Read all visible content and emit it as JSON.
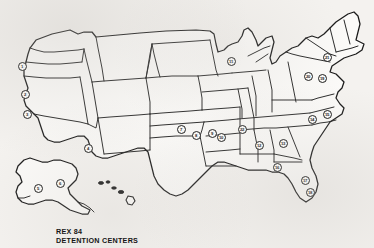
{
  "document": {
    "title": "REX 84 DETENTION CENTERS",
    "type": "map",
    "region": "United States"
  },
  "caption": {
    "line1": "REX 84",
    "line2": "DETENTION CENTERS"
  },
  "colors": {
    "background": "#f4f2ef",
    "land_fill": "#fbfaf8",
    "outline": "#1a1a1a",
    "marker_fill": "#fcfbf9",
    "text": "#151515"
  },
  "map": {
    "projection_note": "conterminous United States with Alaska and Hawaii insets",
    "marker_count": 22,
    "markers": [
      {
        "id": 1,
        "label": "1",
        "x": 22,
        "y": 66,
        "area": "Washington"
      },
      {
        "id": 2,
        "label": "2",
        "x": 25,
        "y": 94,
        "area": "California-north"
      },
      {
        "id": 3,
        "label": "3",
        "x": 27,
        "y": 114,
        "area": "California-central"
      },
      {
        "id": 4,
        "label": "4",
        "x": 88,
        "y": 148,
        "area": "Arizona-New-Mexico"
      },
      {
        "id": 5,
        "label": "5",
        "x": 38,
        "y": 188,
        "area": "Alaska-west"
      },
      {
        "id": 6,
        "label": "6",
        "x": 60,
        "y": 183,
        "area": "Alaska-central"
      },
      {
        "id": 7,
        "label": "7",
        "x": 181,
        "y": 129,
        "area": "Oklahoma"
      },
      {
        "id": 8,
        "label": "8",
        "x": 196,
        "y": 135,
        "area": "Arkansas-west"
      },
      {
        "id": 9,
        "label": "9",
        "x": 212,
        "y": 133,
        "area": "Arkansas-east"
      },
      {
        "id": 10,
        "label": "10",
        "x": 221,
        "y": 137,
        "area": "Mississippi"
      },
      {
        "id": 11,
        "label": "11",
        "x": 231,
        "y": 61,
        "area": "Wisconsin"
      },
      {
        "id": 12,
        "label": "12",
        "x": 259,
        "y": 145,
        "area": "Alabama"
      },
      {
        "id": 13,
        "label": "13",
        "x": 283,
        "y": 143,
        "area": "Georgia"
      },
      {
        "id": 14,
        "label": "14",
        "x": 312,
        "y": 119,
        "area": "North-Carolina"
      },
      {
        "id": 15,
        "label": "15",
        "x": 327,
        "y": 114,
        "area": "North-Carolina-coast"
      },
      {
        "id": 16,
        "label": "16",
        "x": 277,
        "y": 167,
        "area": "Gulf-Coast-Florida-panhandle"
      },
      {
        "id": 17,
        "label": "17",
        "x": 305,
        "y": 180,
        "area": "Florida-central"
      },
      {
        "id": 18,
        "label": "18",
        "x": 310,
        "y": 192,
        "area": "Florida-south"
      },
      {
        "id": 19,
        "label": "19",
        "x": 322,
        "y": 78,
        "area": "Pennsylvania-east"
      },
      {
        "id": 20,
        "label": "20",
        "x": 308,
        "y": 76,
        "area": "Pennsylvania-west"
      },
      {
        "id": 21,
        "label": "21",
        "x": 327,
        "y": 57,
        "area": "New-York"
      },
      {
        "id": 22,
        "label": "22",
        "x": 242,
        "y": 129,
        "area": "Mississippi-south"
      }
    ]
  }
}
